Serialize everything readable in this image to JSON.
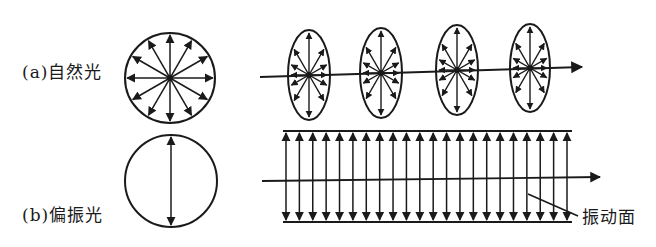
{
  "labels": {
    "natural_light": "(a)自然光",
    "polarized_light": "(b)偏振光",
    "vibration_plane": "振动面"
  },
  "colors": {
    "ink": "#1a1a1a",
    "background": "#ffffff"
  },
  "diagram": {
    "natural_circle": {
      "cx": 170,
      "cy": 78,
      "r": 45,
      "arrow_count": 12
    },
    "natural_ellipses": [
      {
        "cx": 309,
        "cy": 75,
        "rx": 21,
        "ry": 45
      },
      {
        "cx": 381,
        "cy": 73,
        "rx": 21,
        "ry": 45
      },
      {
        "cx": 457,
        "cy": 70,
        "rx": 21,
        "ry": 45
      },
      {
        "cx": 530,
        "cy": 68,
        "rx": 20,
        "ry": 44
      }
    ],
    "natural_axis": {
      "x1": 260,
      "y1": 77,
      "x2": 582,
      "y2": 67
    },
    "polarized_circle": {
      "cx": 171,
      "cy": 181,
      "r": 46
    },
    "polarized_band": {
      "x1": 283,
      "x2": 572,
      "top": 131,
      "bottom": 222,
      "arrow_count": 22
    },
    "polarized_axis": {
      "x1": 262,
      "y1": 181,
      "x2": 600,
      "y2": 177
    },
    "leader_line": {
      "x1": 528,
      "y1": 194,
      "x2": 578,
      "y2": 216
    }
  }
}
